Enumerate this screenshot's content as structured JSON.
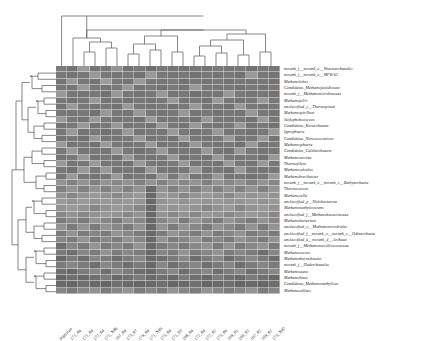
{
  "figure": {
    "type": "clustered-heatmap",
    "colormap": "greyscale",
    "background": "#ffffff",
    "line_color": "#555555"
  },
  "chart_data": {
    "type": "heatmap",
    "title": "",
    "xlabel": "",
    "ylabel": "",
    "grid": false,
    "legend": "none",
    "colormap": "grey",
    "value_range": [
      0,
      1
    ],
    "columns": [
      "Injection",
      "171_86",
      "171_84",
      "172_84",
      "171_X86",
      "167_84",
      "173_87",
      "174_84",
      "171_X85",
      "173_84",
      "171_83",
      "168_84",
      "172_84",
      "172_82",
      "173_86",
      "169_81",
      "160_82",
      "167_82",
      "169_82",
      "173_X87"
    ],
    "rows": [
      "norank_f__norank_o__Woesearchaeales",
      "norank_f__norank_o__MFB-63",
      "Methanolobus",
      "Candidatus_Methanofastidiosum",
      "norank_f__Methanomicrobiaceae",
      "Methanofollis",
      "unclassified_c__Thermoprotei",
      "Methanospirillum",
      "Sulfophobococcus",
      "Candidatus_Korarchaeum",
      "Ignisphaera",
      "Candidatus_Nitrosocosmicus",
      "Methanosphaera",
      "Candidatus_Caldiarchaeum",
      "Methanosarcina",
      "Thermofilum",
      "Methanocalculus",
      "Methanobrevibacter",
      "norank_f__norank_o__norank_c__Bathyarchaeia",
      "Thermococcus",
      "Methanocella",
      "unclassified_p__Halobacterota",
      "Methanomethylovorans",
      "unclassified_f__Methanobacteriaceae",
      "Methanobacterium",
      "unclassified_o__Methanomicrobiales",
      "unclassified_f__norank_o__norank_c__Odinarchaeia",
      "unclassified_k__norank_d__Archaea",
      "norank_f__Methanomassiliicoccaceae",
      "Methanococcus",
      "Methanothermobacter",
      "norank_f__Hadarchaeales",
      "Methanosaeta",
      "Methanolinea",
      "Candidatus_Methanomethylicus",
      "Methanoculleus"
    ],
    "values": [
      [
        0.42,
        0.36,
        0.62,
        0.38,
        0.4,
        0.58,
        0.36,
        0.4,
        0.34,
        0.4,
        0.38,
        0.36,
        0.4,
        0.38,
        0.42,
        0.38,
        0.4,
        0.36,
        0.4,
        0.38
      ],
      [
        0.4,
        0.38,
        0.4,
        0.62,
        0.4,
        0.38,
        0.4,
        0.36,
        0.62,
        0.4,
        0.38,
        0.4,
        0.36,
        0.4,
        0.38,
        0.4,
        0.36,
        0.62,
        0.4,
        0.38
      ],
      [
        0.38,
        0.62,
        0.4,
        0.38,
        0.64,
        0.4,
        0.38,
        0.62,
        0.4,
        0.38,
        0.4,
        0.36,
        0.4,
        0.38,
        0.4,
        0.36,
        0.4,
        0.38,
        0.4,
        0.36
      ],
      [
        0.4,
        0.38,
        0.62,
        0.4,
        0.38,
        0.4,
        0.62,
        0.38,
        0.4,
        0.36,
        0.4,
        0.38,
        0.62,
        0.4,
        0.38,
        0.4,
        0.36,
        0.4,
        0.38,
        0.4
      ],
      [
        0.62,
        0.4,
        0.38,
        0.4,
        0.36,
        0.62,
        0.4,
        0.38,
        0.4,
        0.62,
        0.38,
        0.4,
        0.36,
        0.4,
        0.38,
        0.62,
        0.4,
        0.38,
        0.4,
        0.36
      ],
      [
        0.4,
        0.36,
        0.4,
        0.62,
        0.38,
        0.4,
        0.36,
        0.4,
        0.38,
        0.4,
        0.62,
        0.38,
        0.4,
        0.36,
        0.62,
        0.4,
        0.38,
        0.4,
        0.62,
        0.4
      ],
      [
        0.38,
        0.62,
        0.4,
        0.38,
        0.4,
        0.36,
        0.62,
        0.4,
        0.38,
        0.4,
        0.36,
        0.4,
        0.62,
        0.38,
        0.4,
        0.36,
        0.62,
        0.4,
        0.38,
        0.4
      ],
      [
        0.4,
        0.38,
        0.4,
        0.36,
        0.62,
        0.4,
        0.38,
        0.62,
        0.4,
        0.38,
        0.4,
        0.62,
        0.38,
        0.4,
        0.36,
        0.4,
        0.38,
        0.62,
        0.4,
        0.38
      ],
      [
        0.62,
        0.4,
        0.38,
        0.62,
        0.4,
        0.38,
        0.4,
        0.36,
        0.62,
        0.4,
        0.38,
        0.4,
        0.36,
        0.62,
        0.4,
        0.38,
        0.4,
        0.36,
        0.62,
        0.4
      ],
      [
        0.38,
        0.4,
        0.62,
        0.38,
        0.4,
        0.62,
        0.38,
        0.4,
        0.36,
        0.62,
        0.4,
        0.38,
        0.62,
        0.4,
        0.38,
        0.4,
        0.62,
        0.38,
        0.4,
        0.36
      ],
      [
        0.4,
        0.62,
        0.38,
        0.4,
        0.36,
        0.4,
        0.62,
        0.38,
        0.4,
        0.38,
        0.62,
        0.4,
        0.38,
        0.4,
        0.62,
        0.38,
        0.4,
        0.36,
        0.4,
        0.62
      ],
      [
        0.38,
        0.4,
        0.36,
        0.62,
        0.4,
        0.38,
        0.4,
        0.62,
        0.38,
        0.4,
        0.36,
        0.62,
        0.4,
        0.38,
        0.4,
        0.62,
        0.38,
        0.4,
        0.62,
        0.38
      ],
      [
        0.62,
        0.38,
        0.4,
        0.36,
        0.62,
        0.4,
        0.38,
        0.4,
        0.62,
        0.38,
        0.4,
        0.36,
        0.62,
        0.4,
        0.38,
        0.4,
        0.36,
        0.62,
        0.38,
        0.4
      ],
      [
        0.4,
        0.62,
        0.38,
        0.4,
        0.38,
        0.62,
        0.4,
        0.36,
        0.4,
        0.62,
        0.38,
        0.4,
        0.38,
        0.62,
        0.4,
        0.36,
        0.62,
        0.4,
        0.38,
        0.4
      ],
      [
        0.38,
        0.4,
        0.62,
        0.38,
        0.4,
        0.36,
        0.62,
        0.4,
        0.38,
        0.4,
        0.62,
        0.38,
        0.4,
        0.36,
        0.62,
        0.4,
        0.38,
        0.4,
        0.36,
        0.62
      ],
      [
        0.62,
        0.38,
        0.4,
        0.62,
        0.38,
        0.4,
        0.36,
        0.62,
        0.4,
        0.38,
        0.4,
        0.62,
        0.38,
        0.4,
        0.36,
        0.62,
        0.4,
        0.38,
        0.62,
        0.4
      ],
      [
        0.4,
        0.36,
        0.62,
        0.4,
        0.62,
        0.38,
        0.4,
        0.36,
        0.62,
        0.4,
        0.38,
        0.4,
        0.62,
        0.38,
        0.4,
        0.36,
        0.62,
        0.4,
        0.38,
        0.4
      ],
      [
        0.38,
        0.62,
        0.4,
        0.38,
        0.4,
        0.62,
        0.38,
        0.4,
        0.36,
        0.62,
        0.4,
        0.62,
        0.38,
        0.4,
        0.62,
        0.38,
        0.4,
        0.36,
        0.4,
        0.62
      ],
      [
        0.58,
        0.46,
        0.58,
        0.46,
        0.58,
        0.5,
        0.58,
        0.46,
        0.58,
        0.46,
        0.58,
        0.5,
        0.58,
        0.46,
        0.58,
        0.5,
        0.58,
        0.46,
        0.58,
        0.5
      ],
      [
        0.46,
        0.58,
        0.46,
        0.58,
        0.46,
        0.58,
        0.46,
        0.58,
        0.3,
        0.58,
        0.46,
        0.58,
        0.46,
        0.58,
        0.46,
        0.58,
        0.46,
        0.58,
        0.46,
        0.58
      ],
      [
        0.58,
        0.5,
        0.58,
        0.62,
        0.58,
        0.5,
        0.58,
        0.62,
        0.3,
        0.62,
        0.58,
        0.5,
        0.58,
        0.62,
        0.58,
        0.5,
        0.62,
        0.58,
        0.62,
        0.58
      ],
      [
        0.62,
        0.58,
        0.62,
        0.58,
        0.62,
        0.58,
        0.62,
        0.58,
        0.3,
        0.58,
        0.62,
        0.58,
        0.62,
        0.58,
        0.62,
        0.58,
        0.58,
        0.62,
        0.58,
        0.62
      ],
      [
        0.58,
        0.62,
        0.58,
        0.5,
        0.58,
        0.62,
        0.58,
        0.5,
        0.3,
        0.62,
        0.58,
        0.62,
        0.58,
        0.5,
        0.58,
        0.62,
        0.5,
        0.58,
        0.62,
        0.58
      ],
      [
        0.5,
        0.58,
        0.5,
        0.58,
        0.62,
        0.58,
        0.5,
        0.58,
        0.3,
        0.58,
        0.5,
        0.58,
        0.5,
        0.62,
        0.58,
        0.5,
        0.58,
        0.62,
        0.58,
        0.5
      ],
      [
        0.42,
        0.5,
        0.42,
        0.58,
        0.5,
        0.42,
        0.58,
        0.5,
        0.3,
        0.5,
        0.58,
        0.42,
        0.58,
        0.5,
        0.42,
        0.58,
        0.5,
        0.42,
        0.58,
        0.5
      ],
      [
        0.58,
        0.42,
        0.58,
        0.42,
        0.58,
        0.5,
        0.42,
        0.58,
        0.3,
        0.58,
        0.42,
        0.58,
        0.5,
        0.42,
        0.58,
        0.5,
        0.42,
        0.58,
        0.42,
        0.58
      ],
      [
        0.42,
        0.58,
        0.42,
        0.5,
        0.42,
        0.58,
        0.5,
        0.42,
        0.3,
        0.42,
        0.58,
        0.5,
        0.42,
        0.58,
        0.42,
        0.5,
        0.58,
        0.42,
        0.5,
        0.42
      ],
      [
        0.5,
        0.42,
        0.58,
        0.42,
        0.5,
        0.42,
        0.58,
        0.5,
        0.3,
        0.58,
        0.42,
        0.5,
        0.58,
        0.42,
        0.5,
        0.42,
        0.58,
        0.5,
        0.42,
        0.58
      ],
      [
        0.34,
        0.5,
        0.42,
        0.58,
        0.42,
        0.5,
        0.42,
        0.58,
        0.3,
        0.42,
        0.5,
        0.42,
        0.5,
        0.58,
        0.42,
        0.58,
        0.42,
        0.5,
        0.58,
        0.42
      ],
      [
        0.42,
        0.34,
        0.5,
        0.42,
        0.58,
        0.42,
        0.5,
        0.42,
        0.3,
        0.5,
        0.42,
        0.58,
        0.42,
        0.5,
        0.58,
        0.42,
        0.5,
        0.42,
        0.34,
        0.5
      ],
      [
        0.3,
        0.42,
        0.34,
        0.5,
        0.42,
        0.34,
        0.42,
        0.5,
        0.3,
        0.34,
        0.42,
        0.5,
        0.34,
        0.42,
        0.5,
        0.34,
        0.42,
        0.5,
        0.42,
        0.34
      ],
      [
        0.42,
        0.5,
        0.42,
        0.34,
        0.5,
        0.42,
        0.34,
        0.42,
        0.3,
        0.5,
        0.34,
        0.42,
        0.5,
        0.34,
        0.42,
        0.5,
        0.34,
        0.42,
        0.5,
        0.42
      ],
      [
        0.34,
        0.3,
        0.42,
        0.5,
        0.34,
        0.5,
        0.42,
        0.34,
        0.3,
        0.42,
        0.5,
        0.34,
        0.42,
        0.5,
        0.34,
        0.42,
        0.5,
        0.34,
        0.42,
        0.5
      ],
      [
        0.28,
        0.34,
        0.3,
        0.34,
        0.42,
        0.3,
        0.34,
        0.42,
        0.3,
        0.34,
        0.3,
        0.42,
        0.34,
        0.3,
        0.42,
        0.34,
        0.3,
        0.42,
        0.34,
        0.3
      ],
      [
        0.3,
        0.28,
        0.34,
        0.3,
        0.28,
        0.34,
        0.3,
        0.28,
        0.3,
        0.34,
        0.28,
        0.3,
        0.34,
        0.28,
        0.3,
        0.34,
        0.28,
        0.3,
        0.28,
        0.34
      ],
      [
        0.5,
        0.42,
        0.5,
        0.58,
        0.42,
        0.5,
        0.58,
        0.42,
        0.5,
        0.42,
        0.58,
        0.5,
        0.42,
        0.58,
        0.5,
        0.42,
        0.5,
        0.58,
        0.42,
        0.5
      ]
    ]
  },
  "column_dendrogram": {
    "label": "column-cluster-tree",
    "orientation": "top"
  },
  "row_dendrogram": {
    "label": "row-cluster-tree",
    "orientation": "left"
  }
}
